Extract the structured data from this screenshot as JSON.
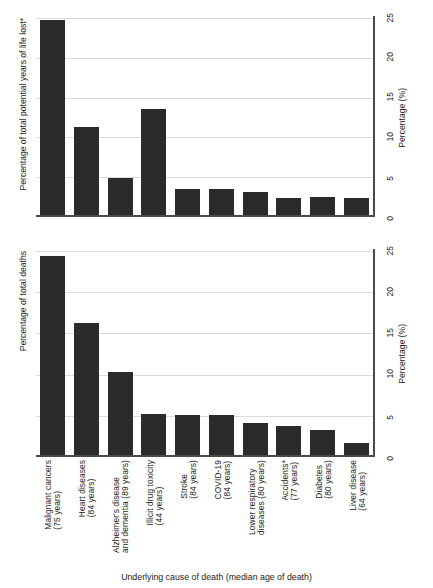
{
  "figure": {
    "xlabel": "Underlying cause of death (median age of death)",
    "value_axis_title": "Percentage (%)"
  },
  "panels": [
    {
      "id": "pyll",
      "ylabel": "Percentage of total potential years of life lost*",
      "value_axis_title": "Percentage (%)"
    },
    {
      "id": "deaths",
      "ylabel": "Percentage of total deaths",
      "value_axis_title": "Percentage (%)"
    }
  ],
  "ticks": [
    "0",
    "5",
    "10",
    "15",
    "20",
    "25"
  ],
  "categories": [
    {
      "name": "Malignant cancers",
      "age": "(75 years)"
    },
    {
      "name": "Heart diseases",
      "age": "(84 years)"
    },
    {
      "name": "Alzheimer's disease and dementia",
      "age": "(89 years)"
    },
    {
      "name": "Illicit drug toxicity",
      "age": "(44 years)"
    },
    {
      "name": "Stroke",
      "age": "(84 years)"
    },
    {
      "name": "COVID-19",
      "age": "(84 years)"
    },
    {
      "name": "Lower respiratory diseases",
      "age": "(80 years)"
    },
    {
      "name": "Accidents*",
      "age": "(77 years)"
    },
    {
      "name": "Diabetes",
      "age": "(80 years)"
    },
    {
      "name": "Liver disease",
      "age": "(64 years)"
    }
  ],
  "chart_data": [
    {
      "type": "bar",
      "title": "Percentage of total potential years of life lost*",
      "xlabel": "Underlying cause of death (median age of death)",
      "ylabel": "Percentage (%)",
      "ylim": [
        0,
        25
      ],
      "yticks": [
        0,
        5,
        10,
        15,
        20,
        25
      ],
      "grid": true,
      "legend": "none",
      "orientation": "vertical",
      "categories": [
        "Malignant cancers (75 years)",
        "Heart diseases (84 years)",
        "Alzheimer's disease and dementia (89 years)",
        "Illicit drug toxicity (44 years)",
        "Stroke (84 years)",
        "COVID-19 (84 years)",
        "Lower respiratory diseases (80 years)",
        "Accidents* (77 years)",
        "Diabetes (80 years)",
        "Liver disease (64 years)"
      ],
      "values": [
        24.7,
        11.2,
        4.7,
        13.5,
        3.4,
        3.4,
        3.0,
        2.2,
        2.3,
        2.2
      ]
    },
    {
      "type": "bar",
      "title": "Percentage of total deaths",
      "xlabel": "Underlying cause of death (median age of death)",
      "ylabel": "Percentage (%)",
      "ylim": [
        0,
        25
      ],
      "yticks": [
        0,
        5,
        10,
        15,
        20,
        25
      ],
      "grid": true,
      "legend": "none",
      "orientation": "vertical",
      "categories": [
        "Malignant cancers (75 years)",
        "Heart diseases (84 years)",
        "Alzheimer's disease and dementia (89 years)",
        "Illicit drug toxicity (44 years)",
        "Stroke (84 years)",
        "COVID-19 (84 years)",
        "Lower respiratory diseases (80 years)",
        "Accidents* (77 years)",
        "Diabetes (80 years)",
        "Liver disease (64 years)"
      ],
      "values": [
        24.4,
        16.2,
        10.2,
        5.1,
        5.0,
        4.9,
        4.0,
        3.6,
        3.1,
        1.5
      ]
    }
  ],
  "colors": {
    "bar": "#2b2b2b",
    "axis": "#4a4a4a",
    "grid": "#dcdcdc",
    "text": "#1a1a1a",
    "background": "#ffffff"
  }
}
